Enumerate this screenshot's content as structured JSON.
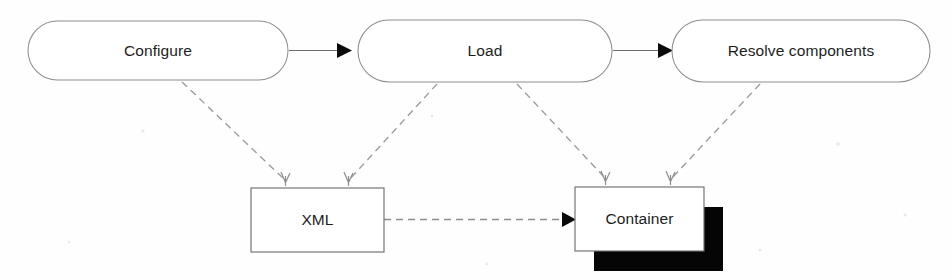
{
  "diagram": {
    "background_color": "#fefefe",
    "text_color": "#1d1d1d",
    "stage_stroke_color": "#8d8d8d",
    "store_stroke_color": "#6f6f6f",
    "flow_arrow_color": "#0a0a0a",
    "dependency_line_color": "#9a9a9a",
    "shadow_color": "#050505"
  },
  "stages": [
    {
      "id": "configure",
      "label": "Configure",
      "shape": "stadium",
      "x": 28,
      "y": 21,
      "width": 260,
      "height": 59
    },
    {
      "id": "load",
      "label": "Load",
      "shape": "stadium",
      "x": 358,
      "y": 20,
      "width": 254,
      "height": 62
    },
    {
      "id": "resolve-components",
      "label": "Resolve components",
      "shape": "stadium",
      "x": 672,
      "y": 20,
      "width": 258,
      "height": 62
    }
  ],
  "stores": [
    {
      "id": "xml",
      "label": "XML",
      "shape": "rectangle",
      "x": 251,
      "y": 188,
      "width": 133,
      "height": 64,
      "shadow": false
    },
    {
      "id": "container",
      "label": "Container",
      "shape": "rectangle",
      "x": 575,
      "y": 187,
      "width": 129,
      "height": 64,
      "shadow": true,
      "shadow_offset_x": 19,
      "shadow_offset_y": 20
    }
  ],
  "flow_arrows": [
    {
      "id": "configure-to-load",
      "from": "configure",
      "to": "load",
      "style": "solid",
      "arrowhead": "filled-triangle"
    },
    {
      "id": "load-to-resolve",
      "from": "load",
      "to": "resolve-components",
      "style": "solid",
      "arrowhead": "filled-triangle"
    }
  ],
  "dependency_arrows": [
    {
      "id": "configure-to-xml",
      "from": "configure",
      "to": "xml",
      "style": "dashed",
      "arrowhead": "open-thin"
    },
    {
      "id": "load-to-xml",
      "from": "load",
      "to": "xml",
      "style": "dashed",
      "arrowhead": "open-thin"
    },
    {
      "id": "load-to-container",
      "from": "load",
      "to": "container",
      "style": "dashed",
      "arrowhead": "open-thin"
    },
    {
      "id": "resolve-to-container",
      "from": "resolve-components",
      "to": "container",
      "style": "dashed",
      "arrowhead": "open-thin"
    },
    {
      "id": "xml-to-container",
      "from": "xml",
      "to": "container",
      "style": "dashed",
      "arrowhead": "filled-triangle"
    }
  ]
}
